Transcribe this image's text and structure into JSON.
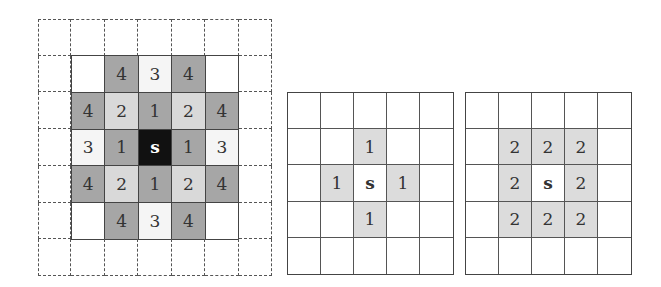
{
  "figure": {
    "colors": {
      "dark_gray": "#a6a6a6",
      "light_gray": "#d9d9d9",
      "off_white": "#f5f5f5",
      "source_black": "#111111",
      "neighbor_shade": "#dcdcdc",
      "grid_line": "#444444"
    }
  },
  "grid_a": {
    "title": "knight-like distance map",
    "size": [
      7,
      7
    ],
    "border_style": "dashed outer ring",
    "cells": [
      [
        "",
        "",
        "",
        "",
        "",
        "",
        ""
      ],
      [
        "",
        "",
        "4",
        "3",
        "4",
        "",
        ""
      ],
      [
        "",
        "4",
        "2",
        "1",
        "2",
        "4",
        ""
      ],
      [
        "",
        "3",
        "1",
        "s",
        "1",
        "3",
        ""
      ],
      [
        "",
        "4",
        "2",
        "1",
        "2",
        "4",
        ""
      ],
      [
        "",
        "",
        "4",
        "3",
        "4",
        "",
        ""
      ],
      [
        "",
        "",
        "",
        "",
        "",
        "",
        ""
      ]
    ]
  },
  "grid_b": {
    "title": "4-neighborhood",
    "size": [
      5,
      5
    ],
    "cells": [
      [
        "",
        "",
        "",
        "",
        ""
      ],
      [
        "",
        "",
        "1",
        "",
        ""
      ],
      [
        "",
        "1",
        "s",
        "1",
        ""
      ],
      [
        "",
        "",
        "1",
        "",
        ""
      ],
      [
        "",
        "",
        "",
        "",
        ""
      ]
    ]
  },
  "grid_c": {
    "title": "8-neighborhood",
    "size": [
      5,
      5
    ],
    "cells": [
      [
        "",
        "",
        "",
        "",
        ""
      ],
      [
        "",
        "2",
        "2",
        "2",
        ""
      ],
      [
        "",
        "2",
        "s",
        "2",
        ""
      ],
      [
        "",
        "2",
        "2",
        "2",
        ""
      ],
      [
        "",
        "",
        "",
        "",
        ""
      ]
    ]
  }
}
